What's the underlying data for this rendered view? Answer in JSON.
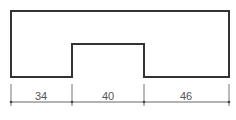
{
  "diagram": {
    "type": "technical-drawing",
    "shape": "rectangle-with-bottom-notch",
    "colors": {
      "outline": "#333333",
      "dimension": "#555555",
      "background": "#ffffff"
    },
    "dimensions": [
      {
        "label": "34",
        "segment": "left"
      },
      {
        "label": "40",
        "segment": "notch"
      },
      {
        "label": "46",
        "segment": "right"
      }
    ]
  }
}
